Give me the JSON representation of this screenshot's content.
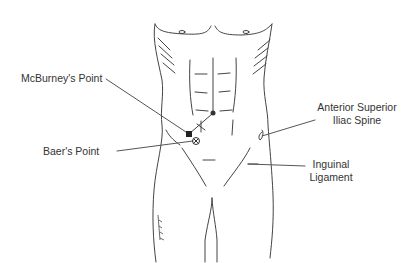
{
  "diagram": {
    "labels": {
      "mcburney": "McBurney's Point",
      "baer": "Baer's Point",
      "asis_line1": "Anterior Superior",
      "asis_line2": "Iliac Spine",
      "inguinal_line1": "Inguinal",
      "inguinal_line2": "Ligament"
    },
    "markers": {
      "umbilicus": "navel",
      "mcburney_marker": "filled square",
      "baer_marker": "circle with cross",
      "x_mark": "x"
    },
    "colors": {
      "line": "#444444",
      "text": "#333333",
      "background": "#ffffff"
    }
  }
}
